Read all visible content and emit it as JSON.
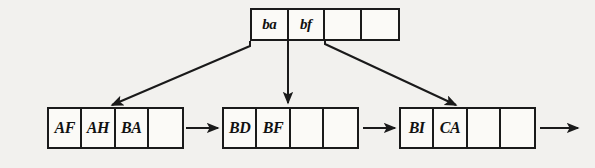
{
  "diagram": {
    "background_color": "#f2f1ee",
    "ink_color": "#1a1a1a",
    "root": {
      "name": "index-node",
      "cells": [
        {
          "label": "ba",
          "empty": false
        },
        {
          "label": "bf",
          "empty": false
        },
        {
          "label": "",
          "empty": true
        },
        {
          "label": "",
          "empty": true
        }
      ]
    },
    "leaves": [
      {
        "name": "leaf-node-1",
        "cells": [
          {
            "label": "AF",
            "empty": false
          },
          {
            "label": "AH",
            "empty": false
          },
          {
            "label": "BA",
            "empty": false
          },
          {
            "label": "",
            "empty": true
          }
        ]
      },
      {
        "name": "leaf-node-2",
        "cells": [
          {
            "label": "BD",
            "empty": false
          },
          {
            "label": "BF",
            "empty": false
          },
          {
            "label": "",
            "empty": true
          },
          {
            "label": "",
            "empty": true
          }
        ]
      },
      {
        "name": "leaf-node-3",
        "cells": [
          {
            "label": "BI",
            "empty": false
          },
          {
            "label": "CA",
            "empty": false
          },
          {
            "label": "",
            "empty": true
          },
          {
            "label": "",
            "empty": true
          }
        ]
      }
    ],
    "pointers": [
      {
        "name": "pointer-root-to-leaf-1",
        "from": "index-node",
        "to": "leaf-node-1",
        "style": "diagonal-left"
      },
      {
        "name": "pointer-root-to-leaf-2",
        "from": "index-node",
        "to": "leaf-node-2",
        "style": "vertical"
      },
      {
        "name": "pointer-root-to-leaf-3",
        "from": "index-node",
        "to": "leaf-node-3",
        "style": "diagonal-right"
      },
      {
        "name": "pointer-leaf-1-to-leaf-2",
        "from": "leaf-node-1",
        "to": "leaf-node-2",
        "style": "horizontal"
      },
      {
        "name": "pointer-leaf-2-to-leaf-3",
        "from": "leaf-node-2",
        "to": "leaf-node-3",
        "style": "horizontal"
      },
      {
        "name": "pointer-leaf-3-to-next",
        "from": "leaf-node-3",
        "to": "",
        "style": "horizontal-open"
      }
    ]
  }
}
